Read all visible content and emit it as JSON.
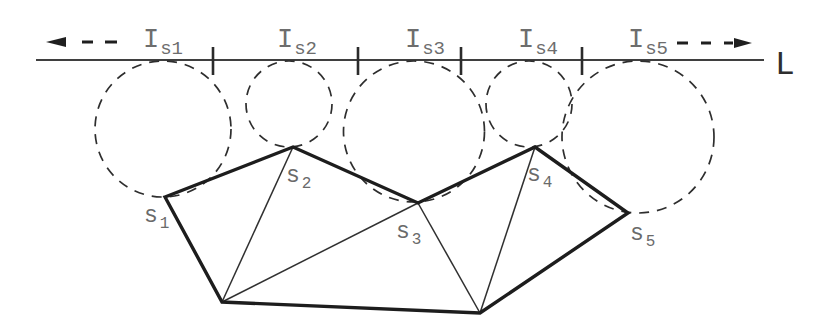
{
  "figure": {
    "canvas": {
      "width": 824,
      "height": 336,
      "background": "#ffffff"
    }
  },
  "colors": {
    "paper": "#ffffff",
    "reference_line": "#3f3f3f",
    "tick": "#2b2b2b",
    "thick_edge": "#1d1d1d",
    "thin_edge": "#303030",
    "dashed_circle": "#2e2e2e",
    "arrow": "#1f1f1f",
    "interval_label": "#6d6d6d",
    "site_label": "#6a6a6a",
    "line_name_label": "#2e2e2e"
  },
  "line_L": {
    "label": "L",
    "y": 60,
    "x1": 36,
    "x2": 764,
    "label_x": 775,
    "label_y": 74,
    "stroke_width": 2,
    "label_font_size": 33
  },
  "arrow_left": {
    "direction": "left",
    "y": 42,
    "tip_x": 46,
    "back_x": 66,
    "half_height": 5,
    "dashes": [
      [
        82,
        93
      ],
      [
        105,
        117
      ]
    ],
    "dash_stroke_width": 3
  },
  "arrow_right": {
    "direction": "right",
    "y": 43,
    "tip_x": 752,
    "back_x": 734,
    "half_height": 5,
    "dashes": [
      [
        677,
        688
      ],
      [
        701,
        711
      ],
      [
        724,
        733
      ]
    ],
    "dash_stroke_width": 3
  },
  "ticks": {
    "xs": [
      213,
      358,
      461,
      582
    ],
    "y1": 47,
    "y2": 75,
    "stroke_width": 2.6
  },
  "interval_labels": [
    {
      "main": "I",
      "sub": "s1",
      "x": 143,
      "y": 47
    },
    {
      "main": "I",
      "sub": "s2",
      "x": 277,
      "y": 47
    },
    {
      "main": "I",
      "sub": "s3",
      "x": 405,
      "y": 47
    },
    {
      "main": "I",
      "sub": "s4",
      "x": 518,
      "y": 47
    },
    {
      "main": "I",
      "sub": "s5",
      "x": 628,
      "y": 47
    }
  ],
  "interval_label_style": {
    "font_size": 27,
    "sub_font_size": 19,
    "sub_dy": 7,
    "sub_dx": 1
  },
  "sites": [
    {
      "id": "s1",
      "x": 165,
      "y": 197,
      "label": {
        "main": "s",
        "sub": "1",
        "x": 144,
        "y": 222
      }
    },
    {
      "id": "s2",
      "x": 293,
      "y": 147,
      "label": {
        "main": "s",
        "sub": "2",
        "x": 286,
        "y": 182
      }
    },
    {
      "id": "s3",
      "x": 418,
      "y": 203,
      "label": {
        "main": "s",
        "sub": "3",
        "x": 396,
        "y": 238
      }
    },
    {
      "id": "s4",
      "x": 535,
      "y": 147,
      "label": {
        "main": "s",
        "sub": "4",
        "x": 527,
        "y": 181
      }
    },
    {
      "id": "s5",
      "x": 628,
      "y": 213,
      "label": {
        "main": "s",
        "sub": "5",
        "x": 630,
        "y": 240
      }
    }
  ],
  "site_label_style": {
    "font_size": 23,
    "sub_font_size": 16,
    "sub_dy": 6,
    "sub_dx": 2
  },
  "bottom_vertices": [
    {
      "id": "b1",
      "x": 222,
      "y": 302
    },
    {
      "id": "b2",
      "x": 480,
      "y": 313
    }
  ],
  "circles": [
    {
      "site": "s1",
      "cx": 163,
      "cy": 129,
      "r": 68
    },
    {
      "site": "s2",
      "cx": 289,
      "cy": 104,
      "r": 43
    },
    {
      "site": "s3",
      "cx": 414,
      "cy": 131.5,
      "r": 70.5
    },
    {
      "site": "s4",
      "cx": 529,
      "cy": 104,
      "r": 43
    },
    {
      "site": "s5",
      "cx": 638,
      "cy": 137,
      "r": 76
    }
  ],
  "circle_style": {
    "stroke_width": 1.7,
    "dash_array": "10 8"
  },
  "polygon": {
    "outline": [
      "s1",
      "s2",
      "s3",
      "s4",
      "s5",
      "b2",
      "b1"
    ],
    "diagonals": [
      [
        "b1",
        "s2"
      ],
      [
        "b1",
        "s3"
      ],
      [
        "b2",
        "s3"
      ],
      [
        "b2",
        "s4"
      ]
    ],
    "thick_width": 3.4,
    "thin_width": 1.5
  }
}
